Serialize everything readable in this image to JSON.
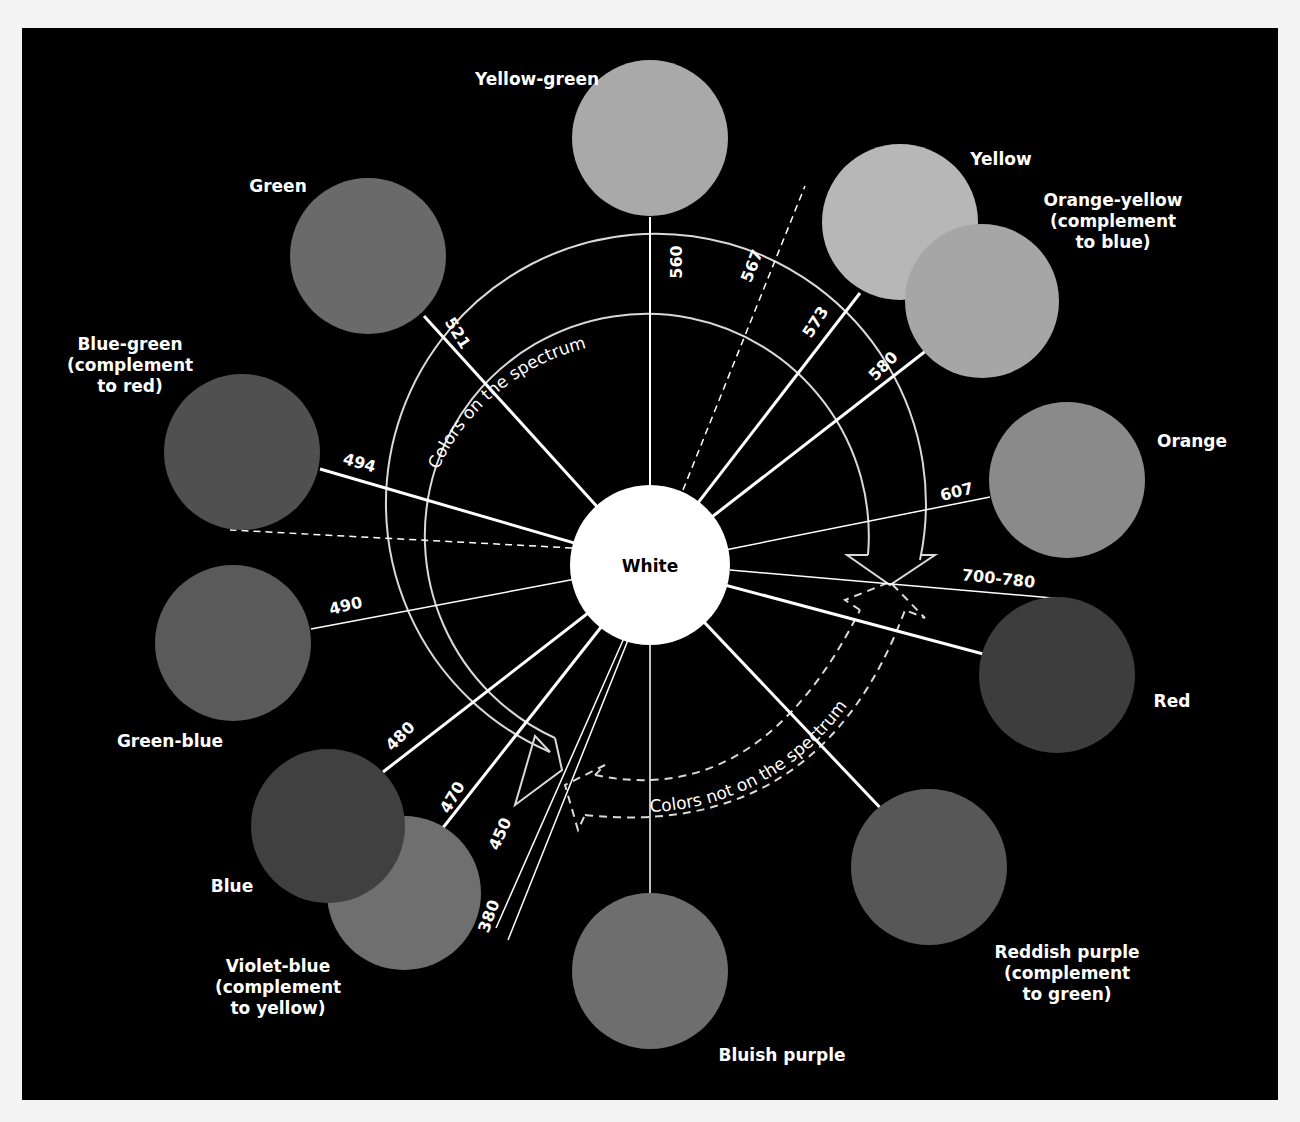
{
  "diagram": {
    "center": {
      "label": "White",
      "x": 650,
      "y": 565,
      "r": 80,
      "color": "#ffffff"
    },
    "colors": [
      {
        "id": "yellow-green",
        "label_lines": [
          "Yellow-green"
        ],
        "circle": {
          "x": 650,
          "y": 138,
          "r": 78,
          "color": "#a9a9a9"
        },
        "wavelength": "560",
        "line_end": {
          "x": 650,
          "y": 217
        },
        "line_width": 2,
        "label_pos": {
          "x": 537,
          "y": 85
        },
        "num_pos": {
          "x": 682,
          "y": 262
        },
        "num_rot": -90,
        "anchor": "middle"
      },
      {
        "id": "yellow",
        "label_lines": [
          "Yellow"
        ],
        "circle": {
          "x": 900,
          "y": 222,
          "r": 78,
          "color": "#b7b7b7"
        },
        "wavelength": "573",
        "line_end": {
          "x": 860,
          "y": 293
        },
        "line_width": 3,
        "label_pos": {
          "x": 1001,
          "y": 165
        },
        "num_pos": {
          "x": 820,
          "y": 325
        },
        "num_rot": -57,
        "anchor": "middle"
      },
      {
        "id": "orange-yellow",
        "label_lines": [
          "Orange-yellow",
          "(complement",
          "to blue)"
        ],
        "circle": {
          "x": 982,
          "y": 301,
          "r": 77,
          "color": "#a6a6a6"
        },
        "wavelength": "580",
        "line_end": {
          "x": 927,
          "y": 350
        },
        "line_width": 3,
        "label_pos": {
          "x": 1113,
          "y": 206
        },
        "num_pos": {
          "x": 887,
          "y": 370
        },
        "num_rot": -45,
        "anchor": "middle"
      },
      {
        "id": "orange",
        "label_lines": [
          "Orange"
        ],
        "circle": {
          "x": 1067,
          "y": 480,
          "r": 78,
          "color": "#8a8a8a"
        },
        "wavelength": "607",
        "line_end": {
          "x": 990,
          "y": 497
        },
        "line_width": 1.5,
        "label_pos": {
          "x": 1192,
          "y": 447
        },
        "num_pos": {
          "x": 958,
          "y": 497
        },
        "num_rot": -14,
        "anchor": "middle"
      },
      {
        "id": "red",
        "label_lines": [
          "Red"
        ],
        "circle": {
          "x": 1057,
          "y": 675,
          "r": 78,
          "color": "#3d3d3d"
        },
        "wavelength": "700-780",
        "line_end": {
          "x": 987,
          "y": 655
        },
        "line_width": 3,
        "label_pos": {
          "x": 1172,
          "y": 707
        },
        "num_pos": {
          "x": 998,
          "y": 584
        },
        "num_rot": 6,
        "anchor": "middle"
      },
      {
        "id": "reddish-purple",
        "label_lines": [
          "Reddish purple",
          "(complement",
          "to green)"
        ],
        "circle": {
          "x": 929,
          "y": 867,
          "r": 78,
          "color": "#575757"
        },
        "wavelength": "",
        "line_end": {
          "x": 887,
          "y": 815
        },
        "line_width": 3,
        "label_pos": {
          "x": 1067,
          "y": 958
        },
        "num_pos": null,
        "num_rot": 0,
        "anchor": "middle"
      },
      {
        "id": "bluish-purple",
        "label_lines": [
          "Bluish purple"
        ],
        "circle": {
          "x": 650,
          "y": 971,
          "r": 78,
          "color": "#6e6e6e"
        },
        "wavelength": "",
        "line_end": {
          "x": 650,
          "y": 893
        },
        "line_width": 1.5,
        "label_pos": {
          "x": 782,
          "y": 1061
        },
        "num_pos": null,
        "num_rot": 0,
        "anchor": "middle"
      },
      {
        "id": "violet-blue",
        "label_lines": [
          "Violet-blue",
          "(complement",
          "to yellow)"
        ],
        "circle": {
          "x": 404,
          "y": 893,
          "r": 77,
          "color": "#6f6f6f"
        },
        "wavelength": "470",
        "line_end": {
          "x": 442,
          "y": 829
        },
        "line_width": 3,
        "label_pos": {
          "x": 278,
          "y": 972
        },
        "num_pos": {
          "x": 457,
          "y": 800
        },
        "num_rot": -60,
        "anchor": "middle"
      },
      {
        "id": "blue",
        "label_lines": [
          "Blue"
        ],
        "circle": {
          "x": 328,
          "y": 826,
          "r": 77,
          "color": "#404040"
        },
        "wavelength": "480",
        "line_end": {
          "x": 383,
          "y": 772
        },
        "line_width": 3,
        "label_pos": {
          "x": 232,
          "y": 892
        },
        "num_pos": {
          "x": 404,
          "y": 740
        },
        "num_rot": -45,
        "anchor": "middle"
      },
      {
        "id": "green-blue",
        "label_lines": [
          "Green-blue"
        ],
        "circle": {
          "x": 233,
          "y": 643,
          "r": 78,
          "color": "#5a5a5a"
        },
        "wavelength": "490",
        "line_end": {
          "x": 311,
          "y": 629
        },
        "line_width": 1.5,
        "label_pos": {
          "x": 170,
          "y": 747
        },
        "num_pos": {
          "x": 347,
          "y": 611
        },
        "num_rot": -14,
        "anchor": "middle"
      },
      {
        "id": "blue-green",
        "label_lines": [
          "Blue-green",
          "(complement",
          "to red)"
        ],
        "circle": {
          "x": 242,
          "y": 452,
          "r": 78,
          "color": "#505050"
        },
        "wavelength": "494",
        "line_end": {
          "x": 320,
          "y": 469
        },
        "line_width": 3,
        "label_pos": {
          "x": 130,
          "y": 350
        },
        "num_pos": {
          "x": 358,
          "y": 468
        },
        "num_rot": 16,
        "anchor": "middle"
      },
      {
        "id": "green",
        "label_lines": [
          "Green"
        ],
        "circle": {
          "x": 368,
          "y": 256,
          "r": 78,
          "color": "#6a6a6a"
        },
        "wavelength": "521",
        "line_end": {
          "x": 424,
          "y": 316
        },
        "line_width": 3,
        "label_pos": {
          "x": 278,
          "y": 192
        },
        "num_pos": {
          "x": 453,
          "y": 336
        },
        "num_rot": 58,
        "anchor": "middle"
      }
    ],
    "extra_lines": [
      {
        "id": "line-567",
        "x1": 683,
        "y1": 490,
        "x2": 805,
        "y2": 186,
        "dashed": true,
        "width": 1.5,
        "label": "567",
        "label_pos": {
          "x": 757,
          "y": 268
        },
        "label_rot": -68
      },
      {
        "id": "line-dashed-blue-green",
        "x1": 572,
        "y1": 548,
        "x2": 230,
        "y2": 530,
        "dashed": true,
        "width": 1.5,
        "label": "",
        "label_pos": null,
        "label_rot": 0
      },
      {
        "id": "line-450",
        "x1": 624,
        "y1": 638,
        "x2": 496,
        "y2": 928,
        "dashed": false,
        "width": 1.5,
        "label": "450",
        "label_pos": {
          "x": 505,
          "y": 836
        },
        "label_rot": -66
      },
      {
        "id": "line-380",
        "x1": 628,
        "y1": 640,
        "x2": 508,
        "y2": 940,
        "dashed": false,
        "width": 1.5,
        "label": "380",
        "label_pos": {
          "x": 494,
          "y": 918
        },
        "label_rot": -70
      },
      {
        "id": "line-700-780",
        "x1": 730,
        "y1": 570,
        "x2": 1075,
        "y2": 600,
        "dashed": false,
        "width": 1.5,
        "label": "",
        "label_pos": null,
        "label_rot": 0
      }
    ],
    "arcs": {
      "on_spectrum_label": "Colors on the spectrum",
      "not_on_spectrum_label": "Colors not on the spectrum",
      "arc_color": "#d9d9d9"
    }
  }
}
